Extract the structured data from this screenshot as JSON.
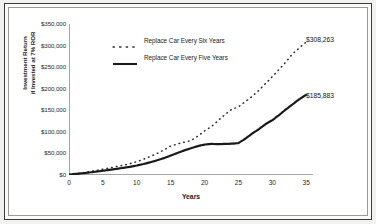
{
  "chart_data": {
    "type": "line",
    "title": "",
    "xlabel": "Years",
    "ylabel_line1": "Investment Return",
    "ylabel_line2": "if Invested at 7% ROR",
    "xlim": [
      0,
      36
    ],
    "ylim": [
      0,
      350000
    ],
    "grid": false,
    "legend_position": "upper-left-inside",
    "x_ticks": [
      "0",
      "5",
      "10",
      "15",
      "20",
      "25",
      "30",
      "35"
    ],
    "x_tick_values": [
      0,
      5,
      10,
      15,
      20,
      25,
      30,
      35
    ],
    "y_ticks": [
      "$0",
      "$50,000",
      "$100,000",
      "$150,000",
      "$200,000",
      "$250,000",
      "$300,000",
      "$350,000"
    ],
    "y_tick_values": [
      0,
      50000,
      100000,
      150000,
      200000,
      250000,
      300000,
      350000
    ],
    "x": [
      0,
      1,
      2,
      3,
      4,
      5,
      6,
      7,
      8,
      9,
      10,
      11,
      12,
      13,
      14,
      15,
      16,
      17,
      18,
      19,
      20,
      21,
      22,
      23,
      24,
      25,
      26,
      27,
      28,
      29,
      30,
      31,
      32,
      33,
      34,
      35
    ],
    "series": [
      {
        "name": "Replace Car Every Six Years",
        "style": "dotted",
        "color": "#2b2b2b",
        "end_label": "$308,263",
        "end_value": 308263,
        "values": [
          1200,
          3000,
          5200,
          7600,
          10400,
          13500,
          16500,
          19500,
          22500,
          26500,
          31000,
          36500,
          43000,
          50000,
          58000,
          67000,
          72000,
          76000,
          80000,
          90000,
          102000,
          112000,
          126000,
          140000,
          152000,
          158000,
          170000,
          182000,
          196000,
          212000,
          228000,
          245000,
          262000,
          281000,
          295000,
          308263
        ]
      },
      {
        "name": "Replace Car Every Five Years",
        "style": "solid",
        "color": "#1a1a1a",
        "end_label": "$185,883",
        "end_value": 185883,
        "values": [
          1000,
          2400,
          4000,
          5800,
          7800,
          9800,
          12000,
          14200,
          16500,
          19000,
          22000,
          25500,
          29500,
          34000,
          39000,
          45000,
          51000,
          57000,
          62000,
          67000,
          70500,
          72000,
          71500,
          72000,
          72500,
          74000,
          84000,
          96000,
          106000,
          118000,
          127000,
          139000,
          152000,
          164000,
          176000,
          185883
        ]
      }
    ]
  },
  "annotations": {
    "six_years_end": "$308,263",
    "five_years_end": "$185,883"
  },
  "legend": {
    "items": [
      {
        "label": "Replace Car Every Six Years",
        "style": "dotted"
      },
      {
        "label": "Replace Car Every Five Years",
        "style": "solid"
      }
    ]
  }
}
